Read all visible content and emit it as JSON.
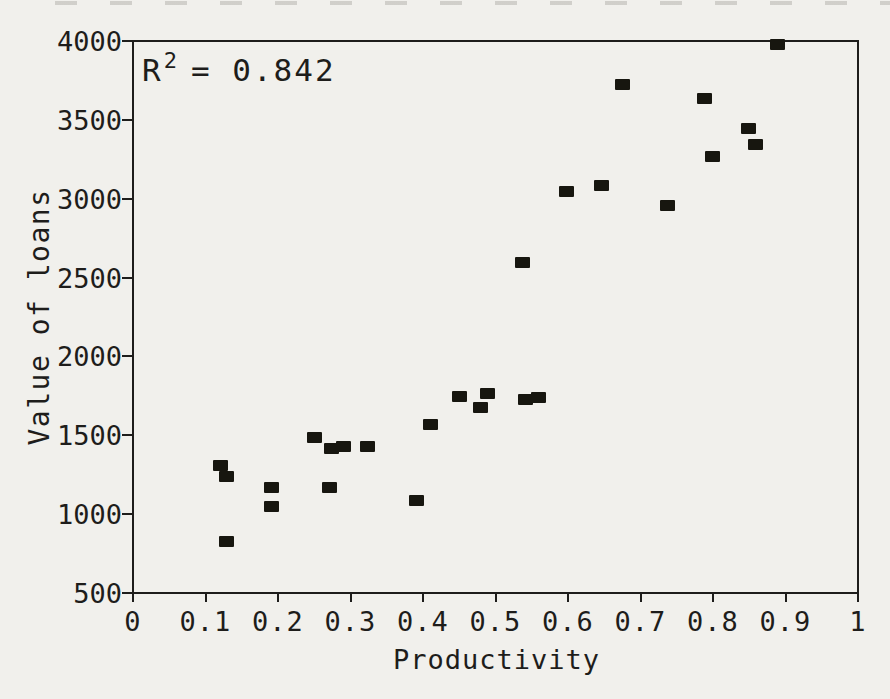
{
  "figure": {
    "background_color": "#f1f0ec",
    "ink_color": "#1e1d1b",
    "marker_color": "#17160f"
  },
  "chart_data": {
    "type": "scatter",
    "title": "",
    "xlabel": "Productivity",
    "ylabel": "Value of loans",
    "annotation": {
      "base": "R",
      "superscript": "2",
      "rest": "= 0.842",
      "r_squared": 0.842
    },
    "xlim": [
      0,
      1
    ],
    "ylim": [
      500,
      4000
    ],
    "x_ticks": [
      0,
      0.1,
      0.2,
      0.3,
      0.4,
      0.5,
      0.6,
      0.7,
      0.8,
      0.9,
      1
    ],
    "x_tick_labels": [
      "0",
      "0.1",
      "0.2",
      "0.3",
      "0.4",
      "0.5",
      "0.6",
      "0.7",
      "0.8",
      "0.9",
      "1"
    ],
    "y_ticks": [
      500,
      1000,
      1500,
      2000,
      2500,
      3000,
      3500,
      4000
    ],
    "y_tick_labels": [
      "500",
      "1000",
      "1500",
      "2000",
      "2500",
      "3000",
      "3500",
      "4000"
    ],
    "grid": false,
    "legend_position": "none",
    "marker": "filled-square",
    "points": [
      [
        0.12,
        1310
      ],
      [
        0.128,
        1240
      ],
      [
        0.128,
        830
      ],
      [
        0.191,
        1170
      ],
      [
        0.191,
        1050
      ],
      [
        0.25,
        1490
      ],
      [
        0.271,
        1170
      ],
      [
        0.273,
        1420
      ],
      [
        0.29,
        1430
      ],
      [
        0.323,
        1430
      ],
      [
        0.391,
        1090
      ],
      [
        0.41,
        1570
      ],
      [
        0.449,
        1750
      ],
      [
        0.478,
        1680
      ],
      [
        0.488,
        1770
      ],
      [
        0.54,
        1730
      ],
      [
        0.558,
        1740
      ],
      [
        0.537,
        2600
      ],
      [
        0.597,
        3050
      ],
      [
        0.646,
        3090
      ],
      [
        0.675,
        3730
      ],
      [
        0.736,
        2960
      ],
      [
        0.787,
        3640
      ],
      [
        0.798,
        3270
      ],
      [
        0.848,
        3450
      ],
      [
        0.858,
        3350
      ],
      [
        0.888,
        3980
      ]
    ]
  }
}
